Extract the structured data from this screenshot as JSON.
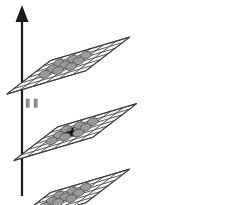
{
  "figure": {
    "title": "Stacked isometric grid layers with node lattice",
    "background_color": "#ffffff",
    "width": 229,
    "height": 205
  },
  "axis": {
    "name": "vertical-axis-arrow",
    "label": "",
    "direction": "up",
    "color": "#1a1a1a",
    "shaft": {
      "x": 22,
      "y_top": 18,
      "y_bottom": 196
    },
    "arrowhead": {
      "apex_x": 22,
      "apex_y": 5,
      "half_width": 6.5,
      "base_y": 22
    }
  },
  "axis_ticks": {
    "name": "axis-tick-pair",
    "color": "#8d8d8d",
    "count": 2,
    "marks": [
      {
        "x": 26,
        "y": 99,
        "width": 3.2,
        "height": 8.5
      },
      {
        "x": 34,
        "y": 99,
        "width": 3.2,
        "height": 8.5
      }
    ]
  },
  "grid_geometry": {
    "cols": 6,
    "rows": 6,
    "cell_dx_right": 13.2,
    "cell_dy_right": -3.9,
    "cell_dx_down": -7.3,
    "cell_dy_down": 5.6,
    "plane_fill": "#fbfbfb",
    "line_color": "#3f3f3f"
  },
  "node_style": {
    "fill": "#9a9a9a",
    "stroke": "#4a4a4a",
    "rx": 5.6,
    "ry": 3.6,
    "rotation_deg": -16
  },
  "layers": [
    {
      "id": "layer-top",
      "name": "grid-plane-top",
      "label": "Top layer",
      "origin_x": 50.5,
      "origin_y": 60.5,
      "nodes": {
        "rows": 3,
        "cols": 3,
        "start_col": 2,
        "start_row": 2,
        "count": 9
      },
      "marker": null
    },
    {
      "id": "layer-middle",
      "name": "grid-plane-middle",
      "label": "Middle layer",
      "origin_x": 57.5,
      "origin_y": 127.0,
      "nodes": {
        "rows": 3,
        "cols": 3,
        "start_col": 2,
        "start_row": 2,
        "count": 9
      },
      "marker": {
        "name": "aircraft-marker",
        "label": "aircraft",
        "color": "#101010",
        "cell_col": 3,
        "cell_row": 3
      }
    },
    {
      "id": "layer-bottom",
      "name": "grid-plane-bottom",
      "label": "Bottom layer",
      "origin_x": 50.5,
      "origin_y": 192.5,
      "nodes": {
        "rows": 3,
        "cols": 3,
        "start_col": 2,
        "start_row": 2,
        "count": 9
      },
      "marker": null
    }
  ]
}
